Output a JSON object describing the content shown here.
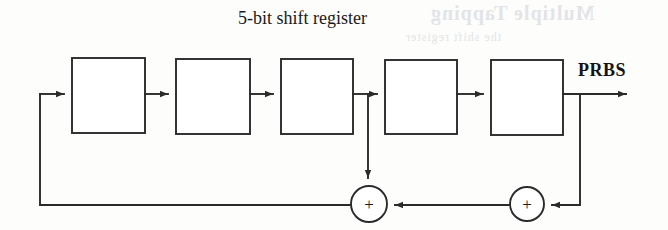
{
  "figure": {
    "title": "5-bit shift register",
    "output_label": "PRBS",
    "background_color": "#fdfdfc",
    "line_color": "#2b2b2b",
    "text_color": "#1a1a1a"
  },
  "bleed_through": {
    "line1": "Multiple Tapping",
    "line2": "the shift register"
  },
  "registers": [
    {
      "name": "stage-1",
      "label": "",
      "x": 72,
      "y": 58,
      "w": 73,
      "h": 75
    },
    {
      "name": "stage-2",
      "label": "",
      "x": 176,
      "y": 59,
      "w": 74,
      "h": 75
    },
    {
      "name": "stage-3",
      "label": "",
      "x": 281,
      "y": 59,
      "w": 72,
      "h": 75
    },
    {
      "name": "stage-4",
      "label": "",
      "x": 385,
      "y": 60,
      "w": 72,
      "h": 74
    },
    {
      "name": "stage-5",
      "label": "",
      "x": 491,
      "y": 60,
      "w": 72,
      "h": 75
    }
  ],
  "adders": [
    {
      "name": "xor-left",
      "symbol": "+",
      "cx": 369,
      "cy": 204,
      "r": 18
    },
    {
      "name": "xor-right",
      "symbol": "+",
      "cx": 527,
      "cy": 204,
      "r": 17
    }
  ],
  "signal_path": {
    "main_line_y": 94,
    "feedback_line_y": 205,
    "feedback_left_x": 40,
    "tap_x": 368,
    "output_branch_x": 580,
    "output_arrow_end_x": 634
  }
}
